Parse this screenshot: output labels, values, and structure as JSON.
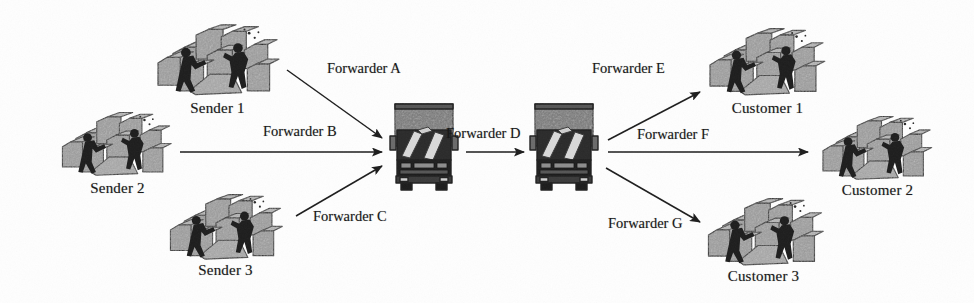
{
  "figure": {
    "type": "flow-diagram",
    "title": "",
    "background_color": "#fefefe",
    "ink_color": "#1b1b1b",
    "box_fill_color": "#9a9a9a",
    "truck_body_color": "#6f6f6f"
  },
  "nodes": [
    {
      "id": "sender1",
      "label": "Sender 1",
      "icon": "warehouse-workers-boxes-icon",
      "x": 150,
      "y": 22,
      "w": 135,
      "h": 80,
      "label_x": 150,
      "label_y": 100,
      "label_w": 135
    },
    {
      "id": "sender2",
      "label": "Sender 2",
      "icon": "warehouse-workers-boxes-icon",
      "x": 56,
      "y": 110,
      "w": 120,
      "h": 72,
      "label_x": 50,
      "label_y": 180,
      "label_w": 135
    },
    {
      "id": "sender3",
      "label": "Sender 3",
      "icon": "warehouse-workers-boxes-icon",
      "x": 163,
      "y": 192,
      "w": 125,
      "h": 74,
      "label_x": 158,
      "label_y": 262,
      "label_w": 135
    },
    {
      "id": "truck1",
      "label": "",
      "icon": "delivery-truck-icon",
      "x": 388,
      "y": 100,
      "w": 72,
      "h": 92,
      "label_x": 0,
      "label_y": 0,
      "label_w": 0
    },
    {
      "id": "truck2",
      "label": "",
      "icon": "delivery-truck-icon",
      "x": 528,
      "y": 100,
      "w": 72,
      "h": 92,
      "label_x": 0,
      "label_y": 0,
      "label_w": 0
    },
    {
      "id": "customer1",
      "label": "Customer 1",
      "icon": "warehouse-workers-boxes-icon",
      "x": 704,
      "y": 26,
      "w": 125,
      "h": 76,
      "label_x": 700,
      "label_y": 100,
      "label_w": 135
    },
    {
      "id": "customer2",
      "label": "Customer 2",
      "icon": "warehouse-workers-boxes-icon",
      "x": 814,
      "y": 114,
      "w": 125,
      "h": 72,
      "label_x": 810,
      "label_y": 182,
      "label_w": 135
    },
    {
      "id": "customer3",
      "label": "Customer 3",
      "icon": "warehouse-workers-boxes-icon",
      "x": 700,
      "y": 196,
      "w": 130,
      "h": 76,
      "label_x": 696,
      "label_y": 268,
      "label_w": 135
    }
  ],
  "edges": [
    {
      "id": "fwdA",
      "label": "Forwarder A",
      "from": "sender1",
      "to": "truck1",
      "x1": 287,
      "y1": 70,
      "x2": 382,
      "y2": 138,
      "label_x": 327,
      "label_y": 60
    },
    {
      "id": "fwdB",
      "label": "Forwarder B",
      "from": "sender2",
      "to": "truck1",
      "x1": 180,
      "y1": 152,
      "x2": 382,
      "y2": 152,
      "label_x": 263,
      "label_y": 123
    },
    {
      "id": "fwdC",
      "label": "Forwarder C",
      "from": "sender3",
      "to": "truck1",
      "x1": 296,
      "y1": 216,
      "x2": 382,
      "y2": 166,
      "label_x": 313,
      "label_y": 208
    },
    {
      "id": "fwdD",
      "label": "Forwarder D",
      "from": "truck1",
      "to": "truck2",
      "x1": 466,
      "y1": 152,
      "x2": 524,
      "y2": 152,
      "label_x": 446,
      "label_y": 125
    },
    {
      "id": "fwdE",
      "label": "Forwarder E",
      "from": "truck2",
      "to": "customer1",
      "x1": 608,
      "y1": 140,
      "x2": 700,
      "y2": 92,
      "label_x": 592,
      "label_y": 60
    },
    {
      "id": "fwdF",
      "label": "Forwarder F",
      "from": "truck2",
      "to": "customer2",
      "x1": 608,
      "y1": 152,
      "x2": 808,
      "y2": 152,
      "label_x": 637,
      "label_y": 126
    },
    {
      "id": "fwdG",
      "label": "Forwarder G",
      "from": "truck2",
      "to": "customer3",
      "x1": 606,
      "y1": 168,
      "x2": 700,
      "y2": 222,
      "label_x": 608,
      "label_y": 215
    }
  ]
}
